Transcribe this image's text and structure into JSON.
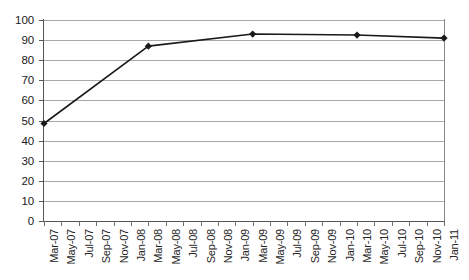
{
  "chart_data": {
    "type": "line",
    "title": "",
    "xlabel": "",
    "ylabel": "",
    "ylim": [
      0,
      100
    ],
    "ytick_step": 10,
    "yticks": [
      0,
      10,
      20,
      30,
      40,
      50,
      60,
      70,
      80,
      90,
      100
    ],
    "grid": "horizontal",
    "legend": "none",
    "marker": "diamond",
    "line_color": "#1a1a1a",
    "marker_color": "#1a1a1a",
    "gridline_color": "#a8a8a8",
    "xticks": [
      "Mar-07",
      "May-07",
      "Jul-07",
      "Sep-07",
      "Nov-07",
      "Jan-08",
      "Mar-08",
      "May-08",
      "Jul-08",
      "Sep-08",
      "Nov-08",
      "Jan-09",
      "Mar-09",
      "May-09",
      "Jul-09",
      "Sep-09",
      "Nov-09",
      "Jan-10",
      "Mar-10",
      "May-10",
      "Jul-10",
      "Sep-10",
      "Nov-10",
      "Jan-11"
    ],
    "x": [
      "Mar-07",
      "Mar-08",
      "Mar-09",
      "Mar-10",
      "Jan-11"
    ],
    "values": [
      48.5,
      87.0,
      93.0,
      92.5,
      91.0
    ],
    "series": [
      {
        "name": "series-1",
        "points": [
          {
            "x": "Mar-07",
            "xi": 0,
            "y": 48.5
          },
          {
            "x": "Mar-08",
            "xi": 6,
            "y": 87.0
          },
          {
            "x": "Mar-09",
            "xi": 12,
            "y": 93.0
          },
          {
            "x": "Mar-10",
            "xi": 18,
            "y": 92.5
          },
          {
            "x": "Jan-11",
            "xi": 23,
            "y": 91.0
          }
        ]
      }
    ]
  }
}
